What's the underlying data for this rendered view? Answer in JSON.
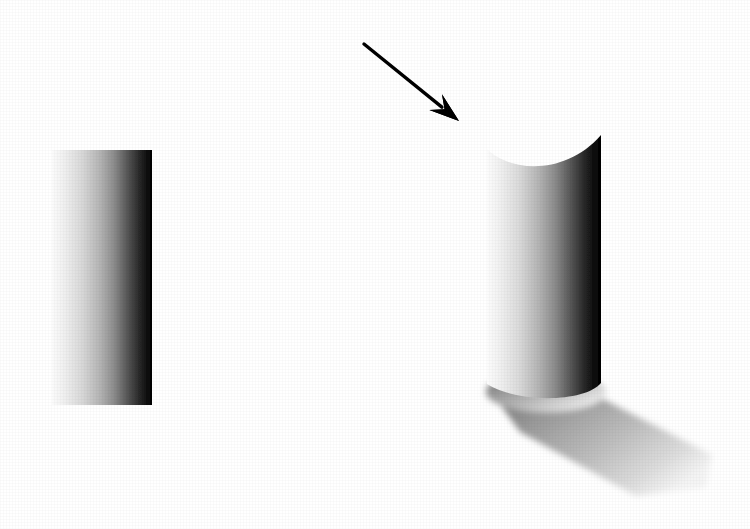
{
  "scene": {
    "title": "Shape-from-shading stimulus: flat shaded rectangle and shaded cylinder with cast shadow",
    "background_color": "#ffffff",
    "width": 750,
    "height": 529
  },
  "objects": {
    "flat_patch": {
      "name": "flat-gradient-rectangle",
      "description": "Flat rectangular patch with horizontal luminance ramp, light at left to black at right",
      "x": 52,
      "y": 150,
      "width": 100,
      "height": 255,
      "gradient_stops": [
        {
          "offset": 0,
          "color": "#fbfbfb"
        },
        {
          "offset": 12,
          "color": "#f0f0f0"
        },
        {
          "offset": 30,
          "color": "#d8d8d8"
        },
        {
          "offset": 48,
          "color": "#b4b4b4"
        },
        {
          "offset": 62,
          "color": "#8c8c8c"
        },
        {
          "offset": 74,
          "color": "#5c5c5c"
        },
        {
          "offset": 86,
          "color": "#2e2e2e"
        },
        {
          "offset": 95,
          "color": "#0d0d0d"
        },
        {
          "offset": 100,
          "color": "#030303"
        }
      ]
    },
    "cylinder": {
      "name": "shaded-cylinder",
      "description": "Vertical cylinder seen slightly from above; concave elliptical rim at top, convex elliptical edge at bottom",
      "left": 487,
      "right": 601,
      "top_peak_y": 135,
      "top_dip_y": 166,
      "bottom_y": 384,
      "bottom_bulge_y": 401,
      "gradient_stops": [
        {
          "offset": 0,
          "color": "#fcfcfc"
        },
        {
          "offset": 10,
          "color": "#f2f2f2"
        },
        {
          "offset": 28,
          "color": "#dadada"
        },
        {
          "offset": 46,
          "color": "#b2b2b2"
        },
        {
          "offset": 60,
          "color": "#8a8a8a"
        },
        {
          "offset": 73,
          "color": "#585858"
        },
        {
          "offset": 85,
          "color": "#2a2a2a"
        },
        {
          "offset": 94,
          "color": "#0c0c0c"
        },
        {
          "offset": 100,
          "color": "#020202"
        }
      ]
    },
    "cast_shadow": {
      "name": "cast-shadow",
      "description": "Soft cast shadow projecting down and to the right from the base of the cylinder, fading toward its far end",
      "origin_x": 487,
      "origin_y": 386,
      "far_x": 712,
      "far_y": 487,
      "gradient_stops": [
        {
          "offset": 0,
          "color": "#6d6d6d"
        },
        {
          "offset": 30,
          "color": "#9a9a9a"
        },
        {
          "offset": 60,
          "color": "#bcbcbc"
        },
        {
          "offset": 85,
          "color": "#dcdcdc"
        },
        {
          "offset": 100,
          "color": "#f4f4f4"
        }
      ]
    },
    "arrow": {
      "name": "pointer-arrow",
      "description": "Solid black arrow pointing down-right toward the top of the cylinder",
      "color": "#000000",
      "tail_x": 364,
      "tail_y": 44,
      "tip_x": 459,
      "tip_y": 121,
      "shaft_width": 3.4,
      "head_length": 30,
      "head_half_width": 10
    }
  }
}
